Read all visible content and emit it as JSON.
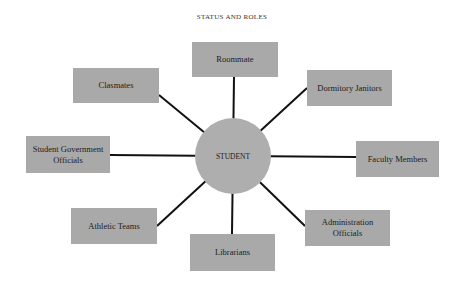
{
  "title": "STATUS AND ROLES",
  "center": {
    "label": "STUDENT",
    "cx": 233,
    "cy": 156,
    "r": 38
  },
  "colors": {
    "box": "#a9a9a9",
    "circle": "#aeaeae",
    "line": "#111111",
    "text": "#1c1c1c"
  },
  "nodes": [
    {
      "id": "roommate",
      "label": "Roommate",
      "x": 192,
      "y": 42,
      "w": 86,
      "h": 35,
      "ax": 234,
      "ay": 77
    },
    {
      "id": "classmates",
      "label": "Clasmates",
      "x": 73,
      "y": 68,
      "w": 86,
      "h": 35,
      "ax": 159,
      "ay": 95
    },
    {
      "id": "dormitory-janitors",
      "label": "Dormitory Janitors",
      "x": 307,
      "y": 70,
      "w": 85,
      "h": 36,
      "ax": 307,
      "ay": 88
    },
    {
      "id": "student-government-officials",
      "label": "Student Government Officials",
      "x": 26,
      "y": 136,
      "w": 84,
      "h": 37,
      "ax": 110,
      "ay": 155
    },
    {
      "id": "faculty-members",
      "label": "Faculty Members",
      "x": 356,
      "y": 141,
      "w": 83,
      "h": 36,
      "ax": 356,
      "ay": 157
    },
    {
      "id": "athletic-teams",
      "label": "Athletic Teams",
      "x": 71,
      "y": 208,
      "w": 86,
      "h": 36,
      "ax": 157,
      "ay": 226
    },
    {
      "id": "librarians",
      "label": "Librarians",
      "x": 190,
      "y": 234,
      "w": 85,
      "h": 37,
      "ax": 232,
      "ay": 234
    },
    {
      "id": "administration-officials",
      "label": "Administration Officials",
      "x": 305,
      "y": 210,
      "w": 85,
      "h": 36,
      "ax": 305,
      "ay": 226
    }
  ]
}
